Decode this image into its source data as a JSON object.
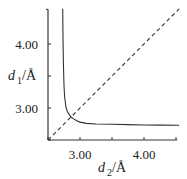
{
  "chart_data": {
    "type": "line",
    "title": "",
    "xlabel": "d2/Å",
    "ylabel": "d1/Å",
    "xlabel_parts": {
      "var": "d",
      "sub": "2",
      "unit": "/Å"
    },
    "ylabel_parts": {
      "var": "d",
      "sub": "1",
      "unit": "/Å"
    },
    "xlim": [
      2.5,
      4.55
    ],
    "ylim": [
      2.5,
      4.55
    ],
    "x_ticks": [
      2.5,
      3.0,
      3.5,
      4.0,
      4.5
    ],
    "y_ticks": [
      2.5,
      3.0,
      3.5,
      4.0
    ],
    "x_tick_labels": [
      {
        "value": 3.0,
        "label": "3.00"
      },
      {
        "value": 4.0,
        "label": "4.00"
      }
    ],
    "y_tick_labels": [
      {
        "value": 3.0,
        "label": "3.00"
      },
      {
        "value": 4.0,
        "label": "4.00"
      }
    ],
    "grid": false,
    "legend": null,
    "series": [
      {
        "name": "hyperbolic bond-order curve",
        "style": "solid",
        "color": "#333333",
        "x": [
          2.73,
          2.735,
          2.74,
          2.75,
          2.76,
          2.78,
          2.8,
          2.83,
          2.86,
          2.9,
          2.95,
          3.0,
          3.1,
          3.25,
          3.5,
          3.75,
          4.0,
          4.25,
          4.55
        ],
        "y": [
          4.55,
          4.1,
          3.7,
          3.35,
          3.18,
          3.02,
          2.95,
          2.9,
          2.86,
          2.83,
          2.8,
          2.78,
          2.76,
          2.75,
          2.745,
          2.74,
          2.735,
          2.733,
          2.73
        ]
      },
      {
        "name": "d1 = d2",
        "style": "dashed",
        "color": "#333333",
        "x": [
          2.5,
          4.55
        ],
        "y": [
          2.5,
          4.55
        ]
      }
    ],
    "annotations": []
  }
}
